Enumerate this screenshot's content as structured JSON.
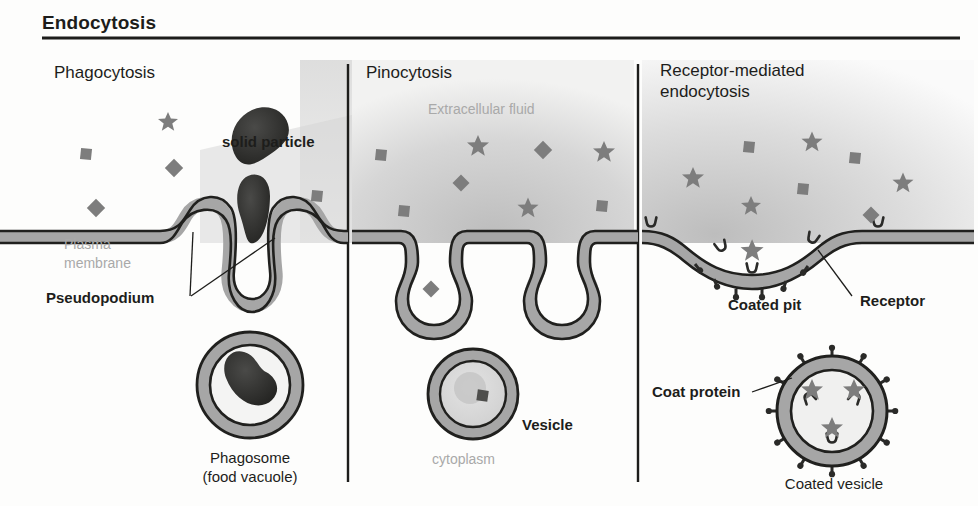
{
  "figure": {
    "title": "Endocytosis",
    "panels": [
      {
        "id": "phagocytosis",
        "heading": "Phagocytosis"
      },
      {
        "id": "pinocytosis",
        "heading": "Pinocytosis"
      },
      {
        "id": "receptor_mediated",
        "heading_line1": "Receptor-mediated",
        "heading_line2": "endocytosis"
      }
    ]
  },
  "labels": {
    "solid_particle": "solid particle",
    "plasma_membrane_l1": "Plasma",
    "plasma_membrane_l2": "membrane",
    "pseudopodium": "Pseudopodium",
    "phagosome_l1": "Phagosome",
    "phagosome_l2": "(food vacuole)",
    "extracellular_fluid": "Extracellular fluid",
    "vesicle": "Vesicle",
    "cytoplasm": "cytoplasm",
    "coated_pit": "Coated pit",
    "receptor": "Receptor",
    "coat_protein": "Coat protein",
    "coated_vesicle": "Coated vesicle"
  },
  "colors": {
    "ink": "#1d1d1b",
    "ghost_text": "#a9a9a9",
    "membrane_fill": "#a6a6a6",
    "membrane_stroke": "#20201e",
    "particle_gray": "#7d7d7d",
    "solid_particle_dark": "#2b2b29",
    "extracellular_top": "#c9c9c9",
    "extracellular_bottom": "#efefef",
    "cytoplasm": "#f7f7f6",
    "vesicle_inner": "#d8d8d8",
    "rule": "#1d1d1b"
  },
  "particles": {
    "phagocytosis": [
      {
        "shape": "square",
        "x": 86,
        "y": 154,
        "size": 11
      },
      {
        "shape": "star",
        "x": 168,
        "y": 122,
        "size": 20
      },
      {
        "shape": "diamond",
        "x": 174,
        "y": 168,
        "size": 13
      },
      {
        "shape": "diamond",
        "x": 96,
        "y": 208,
        "size": 13
      },
      {
        "shape": "square",
        "x": 317,
        "y": 196,
        "size": 11
      },
      {
        "shape": "bean",
        "x": 262,
        "y": 124,
        "size": 58,
        "label": "solid particle"
      },
      {
        "shape": "bean",
        "x": 258,
        "y": 200,
        "size": 52,
        "label": "engulfed particle"
      }
    ],
    "pinocytosis": [
      {
        "shape": "square",
        "x": 381,
        "y": 155,
        "size": 11
      },
      {
        "shape": "star",
        "x": 478,
        "y": 146,
        "size": 22
      },
      {
        "shape": "diamond",
        "x": 543,
        "y": 150,
        "size": 13
      },
      {
        "shape": "star",
        "x": 604,
        "y": 152,
        "size": 22
      },
      {
        "shape": "diamond",
        "x": 461,
        "y": 183,
        "size": 12
      },
      {
        "shape": "square",
        "x": 404,
        "y": 211,
        "size": 11
      },
      {
        "shape": "star",
        "x": 528,
        "y": 208,
        "size": 21
      },
      {
        "shape": "square",
        "x": 602,
        "y": 206,
        "size": 11
      },
      {
        "shape": "diamond",
        "x": 431,
        "y": 289,
        "size": 12
      }
    ],
    "receptor_mediated": [
      {
        "shape": "square",
        "x": 749,
        "y": 147,
        "size": 11
      },
      {
        "shape": "star",
        "x": 812,
        "y": 142,
        "size": 21
      },
      {
        "shape": "square",
        "x": 745,
        "y": 122,
        "size": 0
      },
      {
        "shape": "square",
        "x": 855,
        "y": 158,
        "size": 11
      },
      {
        "shape": "star",
        "x": 693,
        "y": 178,
        "size": 22
      },
      {
        "shape": "square",
        "x": 803,
        "y": 189,
        "size": 11
      },
      {
        "shape": "star",
        "x": 903,
        "y": 183,
        "size": 21
      },
      {
        "shape": "star",
        "x": 751,
        "y": 206,
        "size": 20
      },
      {
        "shape": "diamond",
        "x": 871,
        "y": 215,
        "size": 12
      },
      {
        "shape": "star",
        "x": 731,
        "y": 118,
        "size": 0
      }
    ]
  },
  "structures": {
    "membrane_thickness_px": 13,
    "pseudopodium_count": 2,
    "pinocytic_invaginations": 2,
    "coat_protein_pegs_on_pit": 6,
    "coated_vesicle_pegs": 12,
    "coated_vesicle_ligands": 3
  }
}
